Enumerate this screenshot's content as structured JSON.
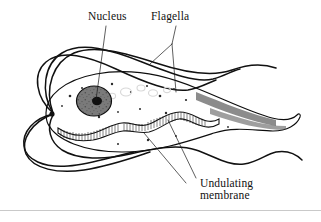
{
  "figure": {
    "kind": "scientific-line-drawing",
    "background_color": "#ffffff",
    "ink_color": "#111111",
    "body_fill_color": "#8a8a8a",
    "membrane_fill_color": "#ffffff",
    "rule_color": "#c9c9c9"
  },
  "labels": {
    "nucleus": "Nucleus",
    "flagella": "Flagella",
    "undulating_line1": "Undulating",
    "undulating_line2": "membrane"
  },
  "parts": {
    "nucleus_name": "nucleus",
    "karyosome_name": "karyosome",
    "basal_body_name": "basal-body",
    "cell_body_name": "cell-body",
    "tail_name": "tapering-tail",
    "undulating_membrane_name": "undulating-membrane",
    "anterior_flagella_count": 4,
    "recurrent_flagella_count": 2
  }
}
